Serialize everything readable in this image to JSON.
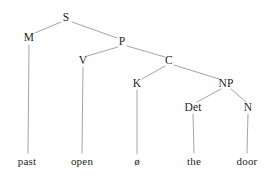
{
  "figure": {
    "kind": "syntax-tree",
    "sentence": "past open ø the door",
    "background_color": "#ffffff",
    "edge_color": "#9a9a9a",
    "text_color": "#231f20"
  },
  "nodes": {
    "s": {
      "label": "S",
      "x": 66,
      "y": 18
    },
    "m": {
      "label": "M",
      "x": 29,
      "y": 38
    },
    "p": {
      "label": "P",
      "x": 122,
      "y": 42
    },
    "v": {
      "label": "V",
      "x": 83,
      "y": 61
    },
    "c": {
      "label": "C",
      "x": 169,
      "y": 61
    },
    "k": {
      "label": "K",
      "x": 137,
      "y": 84
    },
    "np": {
      "label": "NP",
      "x": 226,
      "y": 84
    },
    "det": {
      "label": "Det",
      "x": 193,
      "y": 108
    },
    "n": {
      "label": "N",
      "x": 248,
      "y": 108
    }
  },
  "leaves": {
    "past": {
      "label": "past",
      "x": 27,
      "y": 161
    },
    "open": {
      "label": "open",
      "x": 82,
      "y": 161
    },
    "null": {
      "label": "ø",
      "x": 137,
      "y": 161
    },
    "the": {
      "label": "the",
      "x": 194,
      "y": 161
    },
    "door": {
      "label": "door",
      "x": 247,
      "y": 161
    }
  },
  "edges": [
    {
      "name": "s-to-m",
      "from": "S",
      "to": "M"
    },
    {
      "name": "s-to-p",
      "from": "S",
      "to": "P"
    },
    {
      "name": "m-to-past",
      "from": "M",
      "to": "past"
    },
    {
      "name": "p-to-v",
      "from": "P",
      "to": "V"
    },
    {
      "name": "p-to-c",
      "from": "P",
      "to": "C"
    },
    {
      "name": "v-to-open",
      "from": "V",
      "to": "open"
    },
    {
      "name": "c-to-k",
      "from": "C",
      "to": "K"
    },
    {
      "name": "c-to-np",
      "from": "C",
      "to": "NP"
    },
    {
      "name": "k-to-null",
      "from": "K",
      "to": "ø"
    },
    {
      "name": "np-to-det",
      "from": "NP",
      "to": "Det"
    },
    {
      "name": "np-to-n",
      "from": "NP",
      "to": "N"
    },
    {
      "name": "det-to-the",
      "from": "Det",
      "to": "the"
    },
    {
      "name": "n-to-door",
      "from": "N",
      "to": "door"
    }
  ]
}
